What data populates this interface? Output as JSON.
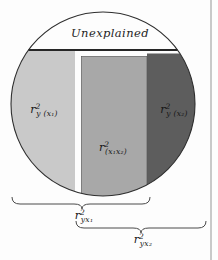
{
  "figure": {
    "unexplained_label": "Unexplained",
    "circle_outline_color": "#2e2e2e",
    "regions": {
      "left": {
        "base": "r",
        "sup": "2",
        "sub": "y (x₁)",
        "fill": "#c9c9c9"
      },
      "middle": {
        "base": "r",
        "sup": "2",
        "sub": "(x₁x₂)",
        "fill": "#a8a8a8"
      },
      "right": {
        "base": "r",
        "sup": "2",
        "sub": "y (x₂)",
        "fill": "#5d5d5d"
      }
    },
    "braces": {
      "first": {
        "base": "r",
        "sup": "2",
        "sub": "yx₁"
      },
      "second": {
        "base": "r",
        "sup": "2",
        "sub": "yx₂"
      }
    }
  }
}
